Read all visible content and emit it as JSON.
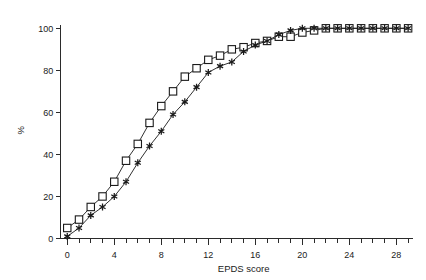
{
  "chart_data": {
    "type": "line",
    "title": "",
    "subtitle": "",
    "xlabel": "EPDS score",
    "ylabel": "%",
    "xlim": [
      -1,
      29.5
    ],
    "ylim": [
      0,
      103
    ],
    "grid": false,
    "legend": "none",
    "x_tick_labels": [
      "0",
      "4",
      "8",
      "12",
      "16",
      "20",
      "24",
      "28"
    ],
    "x_tick_values": [
      0,
      4,
      8,
      12,
      16,
      20,
      24,
      28
    ],
    "x_minor_tick_values": [
      0,
      1,
      2,
      3,
      4,
      5,
      6,
      7,
      8,
      9,
      10,
      11,
      12,
      13,
      14,
      15,
      16,
      17,
      18,
      19,
      20,
      21,
      22,
      23,
      24,
      25,
      26,
      27,
      28,
      29
    ],
    "y_tick_labels": [
      "0",
      "20",
      "40",
      "60",
      "80",
      "100"
    ],
    "y_tick_values": [
      0,
      20,
      40,
      60,
      80,
      100
    ],
    "x": [
      0,
      1,
      2,
      3,
      4,
      5,
      6,
      7,
      8,
      9,
      10,
      11,
      12,
      13,
      14,
      15,
      16,
      17,
      18,
      19,
      20,
      21,
      22,
      23,
      24,
      25,
      26,
      27,
      28,
      29
    ],
    "series": [
      {
        "name": "square-series",
        "marker": "open-square",
        "color": "#1a1a1a",
        "values": [
          5,
          9,
          15,
          20,
          27,
          37,
          45,
          55,
          63,
          70,
          77,
          81,
          85,
          87,
          90,
          91,
          93,
          94,
          96,
          96,
          98,
          99,
          100,
          100,
          100,
          100,
          100,
          100,
          100,
          100
        ]
      },
      {
        "name": "star-series",
        "marker": "filled-star",
        "color": "#1a1a1a",
        "values": [
          1,
          5,
          11,
          15,
          20,
          27,
          36,
          44,
          51,
          59,
          65,
          72,
          79,
          82,
          84,
          89,
          92,
          94,
          97,
          99,
          100,
          100,
          100,
          100,
          100,
          100,
          100,
          100,
          100,
          100
        ]
      }
    ]
  },
  "figure": {
    "background_color": "#ffffff",
    "axis_color": "#2b2b2b",
    "ink_color": "#1a1a1a"
  }
}
